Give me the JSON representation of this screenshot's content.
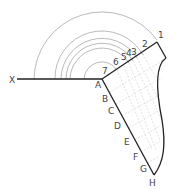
{
  "diagram": {
    "type": "development-construction",
    "colors": {
      "outline": "#222222",
      "arcs": "#999999",
      "grid": "#d4d4d4",
      "label": "#444444"
    },
    "axis_label": "X",
    "origin_label": "A",
    "arc_labels": [
      "1",
      "2",
      "3",
      "4",
      "5",
      "6",
      "7"
    ],
    "edge_labels": [
      "A",
      "B",
      "C",
      "D",
      "E",
      "F",
      "G",
      "H"
    ]
  }
}
